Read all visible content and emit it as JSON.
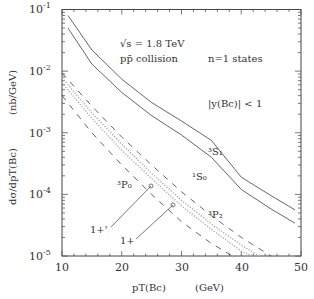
{
  "chart_data": {
    "type": "line",
    "title": "",
    "xlabel": "p_T(B_c)    (GeV)",
    "ylabel": "dσ/dp_T(B_c)    (nb/GeV)",
    "xlim": [
      10,
      50
    ],
    "ylim": [
      1e-05,
      0.1
    ],
    "yscale": "log",
    "x_ticks": [
      "10",
      "20",
      "30",
      "40",
      "50"
    ],
    "y_ticks": [
      "10^-5",
      "10^-4",
      "10^-3",
      "10^-2",
      "10^-1"
    ],
    "grid": false,
    "legend": null,
    "annotations": [
      "√s = 1.8 TeV",
      "pp̄  collision",
      "n=1 states",
      "|y(B_c)| < 1",
      "³S₁",
      "¹S₀",
      "³P₀",
      "³P₂",
      "1+'",
      "1+"
    ],
    "series": [
      {
        "name": "3S1",
        "style": "solid",
        "x": [
          11,
          15,
          20,
          25,
          30,
          35,
          40,
          45,
          49
        ],
        "values": [
          0.08,
          0.022,
          0.0074,
          0.0031,
          0.00155,
          0.00075,
          0.00019,
          9.5e-05,
          5.6e-05
        ]
      },
      {
        "name": "1S0",
        "style": "solid",
        "x": [
          11,
          15,
          20,
          25,
          30,
          35,
          40,
          45,
          49
        ],
        "values": [
          0.05,
          0.013,
          0.0045,
          0.0019,
          0.00092,
          0.0004,
          0.00012,
          5.8e-05,
          3.4e-05
        ]
      },
      {
        "name": "3P2 (upper dashed)",
        "style": "dashed",
        "x": [
          10,
          15,
          20,
          25,
          30,
          35,
          40,
          45
        ],
        "values": [
          0.0093,
          0.0027,
          0.00085,
          0.0003,
          0.00011,
          4.5e-05,
          2e-05,
          1e-05
        ]
      },
      {
        "name": "1+' (dotted)",
        "style": "dotted",
        "x": [
          10,
          15,
          20,
          25,
          30,
          35,
          40,
          43
        ],
        "values": [
          0.0078,
          0.0021,
          0.00065,
          0.00022,
          8e-05,
          3.3e-05,
          1.5e-05,
          1e-05
        ]
      },
      {
        "name": "1+ (dotted)",
        "style": "dotted",
        "x": [
          10,
          15,
          20,
          25,
          30,
          35,
          40,
          42
        ],
        "values": [
          0.0065,
          0.0017,
          0.00052,
          0.00018,
          6.5e-05,
          2.7e-05,
          1.2e-05,
          1e-05
        ]
      },
      {
        "name": "3P0 (lower dashed)",
        "style": "dashed",
        "x": [
          10,
          15,
          20,
          25,
          30,
          35,
          38.5
        ],
        "values": [
          0.004,
          0.001,
          0.0003,
          0.0001,
          3.6e-05,
          1.6e-05,
          1e-05
        ]
      }
    ]
  },
  "labels": {
    "sqrt_s": "√s = 1.8 TeV",
    "collision": "pp̄  collision",
    "states": "n=1 states",
    "rapidity": "|y(Bc)| < 1",
    "s1": "³S₁",
    "s0": "¹S₀",
    "p0": "³P₀",
    "p2": "³P₂",
    "oneplus_prime": "1+'",
    "oneplus": "1+",
    "xlabel_main": "pT(Bc)",
    "xlabel_unit": "(GeV)",
    "ylabel_main": "dσ/dpT(Bc)",
    "ylabel_unit": "(nb/GeV)",
    "xt": [
      "10",
      "20",
      "30",
      "40",
      "50"
    ],
    "yt": [
      "10",
      "10",
      "10",
      "10",
      "10"
    ],
    "ye": [
      "-1",
      "-2",
      "-3",
      "-4",
      "-5"
    ]
  }
}
